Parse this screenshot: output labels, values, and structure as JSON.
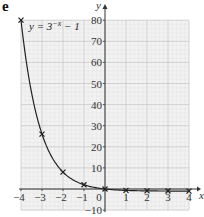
{
  "part_label": "e",
  "chart_data": {
    "type": "line",
    "title": "",
    "function_label": "y = 3^(−x) − 1",
    "function_label_parts": {
      "lhs": "y = 3",
      "exponent": "−x",
      "rhs": " − 1"
    },
    "xlabel": "x",
    "ylabel": "y",
    "xlim": [
      -4,
      4
    ],
    "ylim": [
      -10,
      80
    ],
    "x_ticks": [
      -4,
      -3,
      -2,
      -1,
      0,
      1,
      2,
      3,
      4
    ],
    "y_ticks": [
      -10,
      10,
      20,
      30,
      40,
      50,
      60,
      70,
      80
    ],
    "grid": true,
    "series": [
      {
        "name": "y = 3^(-x) - 1",
        "marker": "x",
        "x": [
          -4,
          -3,
          -2,
          -1,
          0,
          1,
          2,
          3,
          4
        ],
        "values": [
          80,
          26,
          8,
          2,
          0,
          -0.67,
          -0.89,
          -0.96,
          -0.99
        ]
      }
    ],
    "colors": {
      "grid_minor": "#e2e2e2",
      "grid_major": "#c8c8c8",
      "grid_bg": "#f2f2f2",
      "axis": "#333333",
      "curve": "#222222"
    }
  }
}
